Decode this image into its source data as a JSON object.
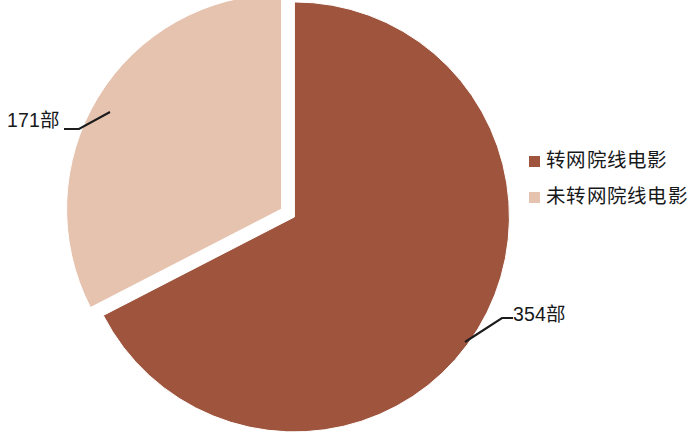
{
  "chart_data": {
    "type": "pie",
    "title": "",
    "subtitle": "",
    "xlabel": "",
    "ylabel": "",
    "unit_suffix": "部",
    "total": 525,
    "categories": [
      "转网院线电影",
      "未转网院线电影"
    ],
    "values": [
      354,
      171
    ],
    "percentages": [
      67.4,
      32.6
    ],
    "data_labels": [
      "354部",
      "171部"
    ],
    "colors": [
      "#9E543D",
      "#E6C3AF"
    ],
    "slice_border_color": "#FFFFFF",
    "explode": [
      0.035,
      0.035
    ],
    "start_angle_deg": 0,
    "direction": "clockwise",
    "grid": false,
    "legend_position": "right",
    "label_position": "outside-with-leader-lines",
    "leader_line_color": "#1C1C1C",
    "background_color": "#FFFFFF",
    "series": [
      {
        "name": "院线电影转网情况",
        "points": [
          {
            "category": "转网院线电影",
            "value": 354,
            "label": "354部",
            "percent": 67.4,
            "color": "#9E543D"
          },
          {
            "category": "未转网院线电影",
            "value": 171,
            "label": "171部",
            "percent": 32.6,
            "color": "#E6C3AF"
          }
        ]
      }
    ]
  },
  "legend": {
    "items": [
      {
        "label": "转网院线电影",
        "color": "#9E543D"
      },
      {
        "label": "未转网院线电影",
        "color": "#E6C3AF"
      }
    ]
  },
  "labels": {
    "pink_callout": "171部",
    "red_callout": "354部"
  }
}
